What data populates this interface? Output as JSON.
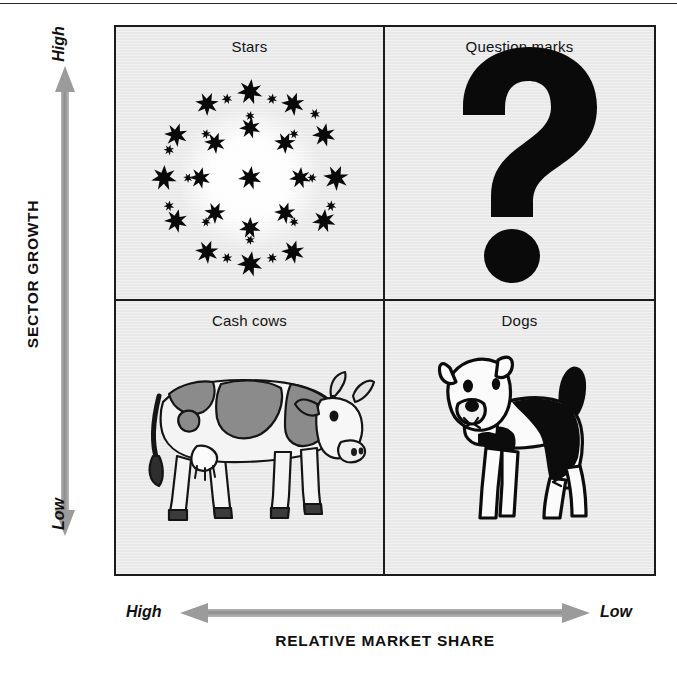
{
  "diagram": {
    "type": "bcg-growth-share-matrix",
    "y_axis": {
      "title": "SECTOR GROWTH",
      "high_label": "High",
      "low_label": "Low",
      "arrow": "double-headed-vertical-arrow",
      "arrow_color": "#9a9a9a"
    },
    "x_axis": {
      "title": "RELATIVE MARKET SHARE",
      "high_label": "High",
      "low_label": "Low",
      "arrow": "double-headed-horizontal-arrow",
      "arrow_color": "#9a9a9a"
    },
    "quadrant_fill": "#e9e9e9",
    "border_color": "#1b1b1b",
    "quadrants": [
      {
        "id": "stars",
        "label": "Stars",
        "position": "top-left",
        "growth": "High",
        "market_share": "High",
        "icon": "star-cluster-icon"
      },
      {
        "id": "question-marks",
        "label": "Question marks",
        "position": "top-right",
        "growth": "High",
        "market_share": "Low",
        "icon": "question-mark-icon"
      },
      {
        "id": "cash-cows",
        "label": "Cash cows",
        "position": "bottom-left",
        "growth": "Low",
        "market_share": "High",
        "icon": "cow-icon"
      },
      {
        "id": "dogs",
        "label": "Dogs",
        "position": "bottom-right",
        "growth": "Low",
        "market_share": "Low",
        "icon": "dog-icon"
      }
    ]
  }
}
